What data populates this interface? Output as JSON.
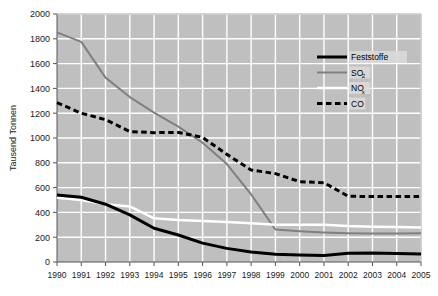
{
  "chart_data": {
    "type": "line",
    "title": "",
    "subtitle": "",
    "xlabel": "",
    "ylabel": "Tausend Tonnen",
    "xlim": [
      1990,
      2005
    ],
    "ylim": [
      0,
      2000
    ],
    "yticks": [
      0,
      200,
      400,
      600,
      800,
      1000,
      1200,
      1400,
      1600,
      1800,
      2000
    ],
    "ytick_labels": [
      "0",
      "200",
      "400",
      "600",
      "800",
      "1000",
      "1200",
      "1400",
      "1600",
      "1800",
      "2000"
    ],
    "grid": true,
    "grid_color": "#ffffff",
    "plot_background": "#bfbfbf",
    "legend_position": "upper-right",
    "categories": [
      1990,
      1991,
      1992,
      1993,
      1994,
      1995,
      1996,
      1997,
      1998,
      1999,
      2000,
      2001,
      2002,
      2003,
      2004,
      2005
    ],
    "xtick_labels": [
      "1990",
      "1991",
      "1992",
      "1993",
      "1994",
      "1995",
      "1996",
      "1997",
      "1998",
      "1999",
      "2000",
      "2001",
      "2002",
      "2003",
      "2004",
      "2005"
    ],
    "series": [
      {
        "name": "Feststoffe",
        "label_plain": "Feststoffe",
        "color": "#000000",
        "style": "solid",
        "width": 3,
        "values": [
          540,
          522,
          466,
          380,
          272,
          218,
          152,
          110,
          80,
          62,
          57,
          53,
          70,
          73,
          68,
          65
        ]
      },
      {
        "name": "SO2",
        "label_plain": "SO",
        "label_sub": "2",
        "color": "#808080",
        "style": "solid",
        "width": 2,
        "values": [
          1852,
          1775,
          1487,
          1330,
          1205,
          1092,
          962,
          790,
          545,
          262,
          248,
          238,
          232,
          230,
          230,
          232
        ]
      },
      {
        "name": "NOx",
        "label_plain": "NO",
        "label_sub": "x",
        "color": "#ffffff",
        "style": "solid",
        "width": 2.5,
        "values": [
          518,
          500,
          466,
          448,
          352,
          338,
          330,
          322,
          312,
          300,
          300,
          300,
          290,
          285,
          282,
          278
        ]
      },
      {
        "name": "CO",
        "label_plain": "CO",
        "color": "#000000",
        "style": "dashed",
        "width": 3,
        "values": [
          1285,
          1200,
          1148,
          1052,
          1043,
          1045,
          1005,
          868,
          742,
          713,
          648,
          640,
          530,
          528,
          528,
          528
        ]
      }
    ]
  },
  "legend": {
    "items": [
      {
        "label": "Feststoffe",
        "sub": ""
      },
      {
        "label": "SO",
        "sub": "2"
      },
      {
        "label": "NO",
        "sub": "x"
      },
      {
        "label": "CO",
        "sub": ""
      }
    ]
  },
  "axis": {
    "y_title": "Tausend Tonnen"
  }
}
